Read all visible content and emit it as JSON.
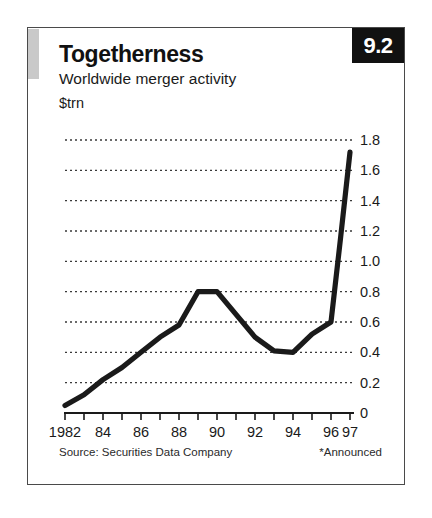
{
  "badge": {
    "number": "9.2"
  },
  "header": {
    "title": "Togetherness",
    "subtitle": "Worldwide merger activity",
    "unit": "$trn"
  },
  "footer": {
    "source": "Source: Securities Data Company",
    "footnote": "*Announced"
  },
  "chart_data": {
    "type": "line",
    "title": "Togetherness",
    "subtitle": "Worldwide merger activity",
    "xlabel": "",
    "ylabel": "$trn",
    "ylim": [
      0,
      1.8
    ],
    "xlim": [
      1982,
      1997
    ],
    "grid": true,
    "grid_style": "dotted-horizontal",
    "legend": "none",
    "line_color": "#1a1a1a",
    "x": [
      1982,
      1983,
      1984,
      1985,
      1986,
      1987,
      1988,
      1989,
      1990,
      1991,
      1992,
      1993,
      1994,
      1995,
      1996,
      1997
    ],
    "values": [
      0.05,
      0.12,
      0.22,
      0.3,
      0.4,
      0.5,
      0.58,
      0.8,
      0.8,
      0.65,
      0.5,
      0.41,
      0.4,
      0.52,
      0.6,
      0.95
    ],
    "series": [
      {
        "name": "Worldwide merger activity",
        "values": [
          0.05,
          0.12,
          0.22,
          0.3,
          0.4,
          0.5,
          0.58,
          0.8,
          0.8,
          0.65,
          0.5,
          0.41,
          0.4,
          0.52,
          0.6,
          0.95
        ]
      }
    ],
    "x_extended": [
      1982,
      1983,
      1984,
      1985,
      1986,
      1987,
      1988,
      1989,
      1990,
      1991,
      1992,
      1993,
      1994,
      1995,
      1996,
      1996.5,
      1997
    ],
    "values_extended": [
      0.05,
      0.12,
      0.22,
      0.3,
      0.4,
      0.5,
      0.58,
      0.8,
      0.8,
      0.65,
      0.5,
      0.41,
      0.4,
      0.52,
      0.6,
      1.15,
      1.72
    ],
    "ytick_labels": [
      "1.8",
      "1.6",
      "1.4",
      "1.2",
      "1.0",
      "0.8",
      "0.6",
      "0.4",
      "0.2",
      "0"
    ],
    "ytick_values": [
      1.8,
      1.6,
      1.4,
      1.2,
      1.0,
      0.8,
      0.6,
      0.4,
      0.2,
      0
    ],
    "xtick_labels": [
      "1982",
      "84",
      "86",
      "88",
      "90",
      "92",
      "94",
      "96",
      "97"
    ],
    "xtick_values": [
      1982,
      1984,
      1986,
      1988,
      1990,
      1992,
      1994,
      1996,
      1997
    ],
    "xtick_minor_values": [
      1983,
      1985,
      1987,
      1989,
      1991,
      1993,
      1995
    ]
  }
}
